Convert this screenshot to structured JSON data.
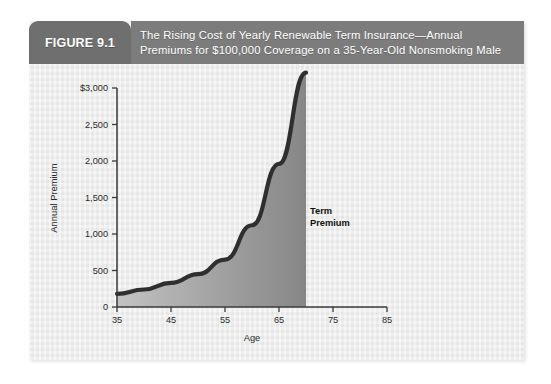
{
  "figure": {
    "tab_label": "FIGURE 9.1",
    "title_line_1": "The Rising Cost of Yearly Renewable Term Insurance—Annual",
    "title_line_2": "Premiums for $100,000 Coverage on a 35-Year-Old Nonsmoking Male",
    "tab_color": "#6f6f6f",
    "band_color": "#7c7c7c",
    "panel_color": "#ececec"
  },
  "chart_data": {
    "type": "area",
    "title": "The Rising Cost of Yearly Renewable Term Insurance—Annual Premiums for $100,000 Coverage on a 35-Year-Old Nonsmoking Male",
    "xlabel": "Age",
    "ylabel": "Annual Premium",
    "xlim": [
      30,
      85
    ],
    "ylim": [
      0,
      3000
    ],
    "xticks": [
      35,
      45,
      55,
      65,
      75,
      85
    ],
    "xtick_labels": [
      "35",
      "45",
      "55",
      "65",
      "75",
      "85"
    ],
    "yticks": [
      0,
      500,
      1000,
      1500,
      2000,
      2500,
      3000
    ],
    "ytick_labels": [
      "0",
      "500",
      "1,000",
      "1,500",
      "2,000",
      "2,500",
      "3,000"
    ],
    "ytick_top_label": "$3,000",
    "grid": false,
    "legend": "none",
    "series": [
      {
        "name": "Term Premium",
        "annotation_line_1": "Term",
        "annotation_line_2": "Premium",
        "line_color": "#2b2b2b",
        "fill_gradient_from": "#bdbdbd",
        "fill_gradient_to": "#8a8a8a",
        "x": [
          35,
          40,
          45,
          50,
          55,
          60,
          65,
          70
        ],
        "values": [
          180,
          240,
          330,
          450,
          650,
          1120,
          1960,
          3210
        ]
      }
    ]
  }
}
